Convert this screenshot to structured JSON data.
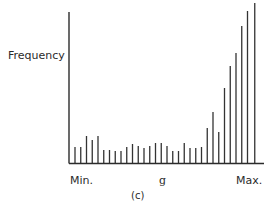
{
  "chart_data": {
    "type": "bar",
    "title": "",
    "caption": "(c)",
    "xlabel": "g",
    "ylabel": "Frequency",
    "x_tick_labels": {
      "min": "Min.",
      "max": "Max."
    },
    "grid": false,
    "legend": null,
    "categories": [
      1,
      2,
      3,
      4,
      5,
      6,
      7,
      8,
      9,
      10,
      11,
      12,
      13,
      14,
      15,
      16,
      17,
      18,
      19,
      20,
      21,
      22,
      23,
      24,
      25,
      26,
      27,
      28,
      29,
      30,
      31,
      32
    ],
    "values": [
      16,
      16,
      27,
      23,
      27,
      13,
      13,
      12,
      12,
      16,
      19,
      17,
      15,
      17,
      20,
      20,
      17,
      12,
      12,
      20,
      15,
      15,
      16,
      35,
      51,
      31,
      75,
      97,
      110,
      137,
      152,
      160
    ],
    "ylim": [
      0,
      160
    ]
  },
  "labels": {
    "ylabel": "Frequency",
    "xmin": "Min.",
    "xmid": "g",
    "xmax": "Max.",
    "caption": "(c)"
  },
  "colors": {
    "bars": "#333333",
    "axes": "#2b2b2b",
    "background": "#ffffff"
  }
}
